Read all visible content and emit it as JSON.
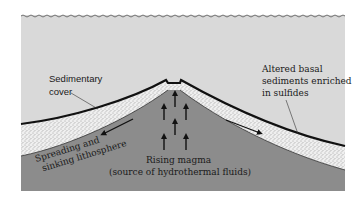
{
  "diagram": {
    "colors": {
      "background": "#ffffff",
      "seawater": "#d9d9d9",
      "magma": "#8c8c8c",
      "sediment": "#ececec",
      "crust_line": "#111111",
      "text": "#1a1a1a"
    },
    "labels": {
      "sedimentary_cover": [
        "Sedimentary",
        "cover"
      ],
      "altered_sediments": [
        "Altered basal",
        "sediments enriched",
        "in sulfides"
      ],
      "spreading": [
        "Spreading and",
        "sinking lithosphere"
      ],
      "rising_magma": [
        "Rising magma",
        "(source of hydrothermal fluids)"
      ]
    },
    "icons": {
      "upward_arrows": 7,
      "spreading_arrows": 2
    }
  }
}
